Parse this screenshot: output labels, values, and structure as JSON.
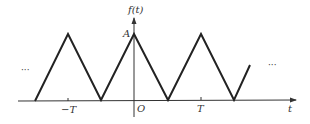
{
  "figure": {
    "ylabel": "f(t)",
    "xlabel": "t",
    "origin_label": "O",
    "amplitude_label": "A",
    "ticks": [
      {
        "label": "−T",
        "value": -1
      },
      {
        "label": "T",
        "value": 1
      }
    ],
    "left_ellipsis": "···",
    "right_ellipsis": "···",
    "signal_type": "periodic triangular wave",
    "colors": {
      "line": "#222222",
      "axis": "#333333",
      "text": "#333333"
    }
  }
}
